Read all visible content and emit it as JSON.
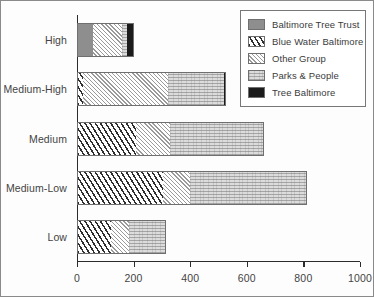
{
  "chart_data": {
    "type": "bar",
    "orientation": "horizontal",
    "stacked": true,
    "title": "",
    "xlabel": "",
    "ylabel": "",
    "xlim": [
      0,
      1000
    ],
    "xticks": [
      0,
      200,
      400,
      600,
      800,
      1000
    ],
    "xtick_labels": [
      "0",
      "200",
      "400",
      "600",
      "800",
      "1000"
    ],
    "grid": false,
    "legend_position": "top-right",
    "categories": [
      "High",
      "Medium-High",
      "Medium",
      "Medium-Low",
      "Low"
    ],
    "series": [
      {
        "name": "Baltimore Tree Trust",
        "pattern": "solid-gray",
        "color": "#8e8e8e",
        "values": [
          55,
          0,
          0,
          0,
          0
        ]
      },
      {
        "name": "Blue Water Baltimore",
        "pattern": "dashes",
        "color": "#2e2e2e",
        "values": [
          0,
          20,
          210,
          305,
          120
        ]
      },
      {
        "name": "Other Group",
        "pattern": "diagonal-hatch",
        "color": "#9a9a9a",
        "values": [
          103,
          300,
          120,
          95,
          65
        ]
      },
      {
        "name": "Parks & People",
        "pattern": "horizontal-lines",
        "color": "#dcdcdc",
        "values": [
          20,
          200,
          330,
          412,
          129
        ]
      },
      {
        "name": "Tree Baltimore",
        "pattern": "solid-black",
        "color": "#1b1b1b",
        "values": [
          22,
          5,
          0,
          0,
          0
        ]
      }
    ],
    "totals": [
      200,
      525,
      660,
      812,
      314
    ]
  },
  "legend": {
    "items": [
      {
        "label": "Baltimore Tree Trust"
      },
      {
        "label": "Blue Water Baltimore"
      },
      {
        "label": "Other Group"
      },
      {
        "label": "Parks & People"
      },
      {
        "label": "Tree Baltimore"
      }
    ]
  }
}
